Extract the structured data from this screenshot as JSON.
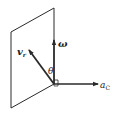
{
  "diagram": {
    "labels": {
      "omega": "ω",
      "vr_main": "v",
      "vr_sub": "r",
      "theta": "θ",
      "ac_main": "a",
      "ac_sub": "C"
    },
    "colors": {
      "stroke": "#2a2a2a",
      "background": "#ffffff"
    }
  }
}
